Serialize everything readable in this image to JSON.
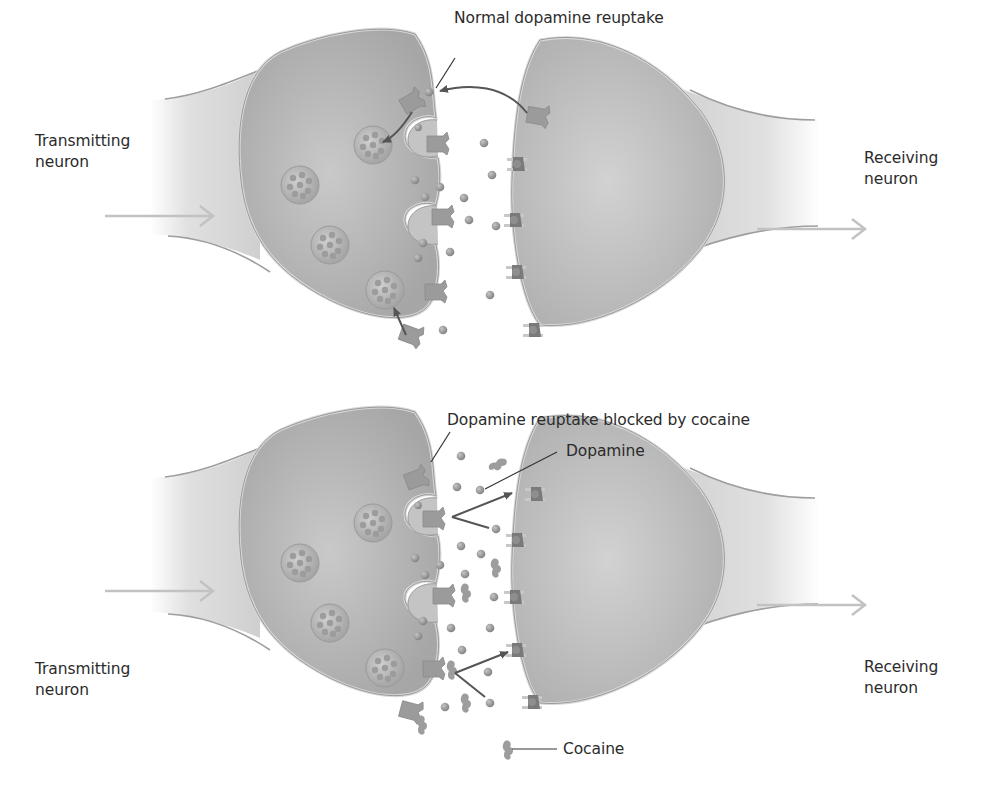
{
  "panels": [
    {
      "id": "normal",
      "labels": {
        "title": "Normal dopamine reuptake",
        "transmitting_line1": "Transmitting",
        "transmitting_line2": "neuron",
        "receiving_line1": "Receiving",
        "receiving_line2": "neuron"
      }
    },
    {
      "id": "cocaine",
      "labels": {
        "title": "Dopamine reuptake blocked by cocaine",
        "dopamine": "Dopamine",
        "cocaine": "Cocaine",
        "transmitting_line1": "Transmitting",
        "transmitting_line2": "neuron",
        "receiving_line1": "Receiving",
        "receiving_line2": "neuron"
      }
    }
  ],
  "colors": {
    "neuron_fill": "#b9b9b9",
    "neuron_dark": "#a3a3a3",
    "membrane": "#d6d6d6",
    "axon_fill": "#d4d4d4",
    "dopamine": "#8e8e8e",
    "transporter": "#9a9a9a",
    "arrow": "#555555",
    "signal_arrow": "#bdbdbd",
    "text": "#2b2b2b"
  }
}
